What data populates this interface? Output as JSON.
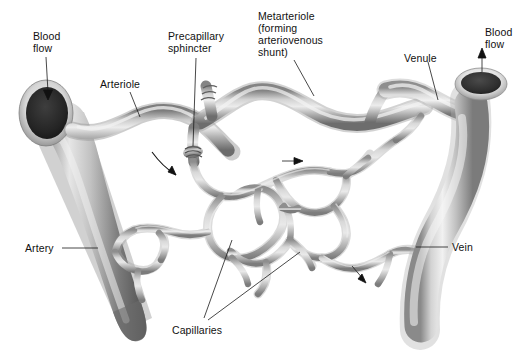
{
  "figure": {
    "background_color": "#ffffff",
    "text_color": "#111111",
    "width": 531,
    "height": 361
  },
  "palette": {
    "vessel_light": "#e8e8e8",
    "vessel_mid": "#b4b4b4",
    "vessel_dark": "#6e6e6e",
    "vessel_darkest": "#4a4a4a",
    "artery_dark": "#555555",
    "artery_highlight": "#efefef",
    "vein_light": "#dedede",
    "lumen_dark": "#2b2b2b",
    "capillary_mid": "#a9a9a9",
    "capillary_dark": "#808080",
    "outline": "#111111"
  },
  "labels": {
    "blood_flow_left": {
      "line1": "Blood",
      "line2": "flow",
      "x": 33,
      "y": 33
    },
    "arteriole": {
      "text": "Arteriole",
      "x": 100,
      "y": 86
    },
    "precapillary_sphincter": {
      "line1": "Precapillary",
      "line2": "sphincter",
      "x": 172,
      "y": 38
    },
    "metarteriole": {
      "line1": "Metarteriole",
      "line2": "(forming",
      "line3": "arteriovenous",
      "line4": "shunt)",
      "x": 260,
      "y": 14
    },
    "venule": {
      "text": "Venule",
      "x": 406,
      "y": 56
    },
    "blood_flow_right": {
      "line1": "Blood",
      "line2": "flow",
      "x": 487,
      "y": 29
    },
    "artery": {
      "text": "Artery",
      "x": 26,
      "y": 251
    },
    "vein": {
      "text": "Vein",
      "x": 452,
      "y": 250
    },
    "capillaries": {
      "text": "Capillaries",
      "x": 172,
      "y": 330
    }
  },
  "flow_arrows": [
    {
      "name": "arrow-into-capillary-bed",
      "style": "curved",
      "direction": "down-right"
    },
    {
      "name": "arrow-metarteriole-flow",
      "style": "straight",
      "direction": "right"
    },
    {
      "name": "arrow-venous-return",
      "style": "straight",
      "direction": "down-right"
    },
    {
      "name": "arrow-blood-flow-in",
      "style": "straight",
      "direction": "down"
    },
    {
      "name": "arrow-blood-flow-out",
      "style": "straight",
      "direction": "up"
    }
  ],
  "structures": [
    "artery",
    "arteriole",
    "precapillary-sphincter",
    "metarteriole",
    "capillary-bed",
    "venule",
    "vein"
  ]
}
